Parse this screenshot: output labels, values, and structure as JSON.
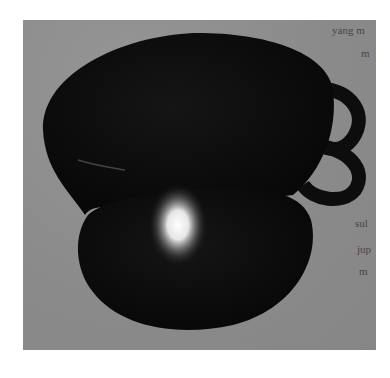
{
  "image": {
    "description": "Grayscale photograph of a dark glossy gourd-shaped vessel (two stacked lobes) with two loop handles on the right side and a bright specular highlight on the lower lobe, on a gray background; cropped page text visible at right edge",
    "colors": {
      "page_background": "#ffffff",
      "photo_background": "#8e8e8e",
      "vessel": "#0d0d0d",
      "highlight": "#f4f4f4",
      "text": "#3a3a3a"
    }
  },
  "bleed_text": [
    {
      "text": "yang m",
      "x": 332,
      "y": 30
    },
    {
      "text": "m",
      "x": 361,
      "y": 53
    },
    {
      "text": "sul",
      "x": 355,
      "y": 223
    },
    {
      "text": "jup",
      "x": 357,
      "y": 249
    },
    {
      "text": "m",
      "x": 359,
      "y": 271
    }
  ]
}
